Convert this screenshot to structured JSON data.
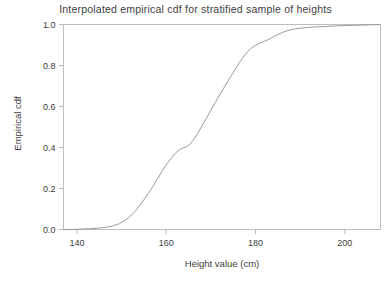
{
  "chart_data": {
    "type": "line",
    "title": "Interpolated empirical cdf for stratified sample of heights",
    "xlabel": "Height value (cm)",
    "ylabel": "Empirical cdf",
    "xlim": [
      137,
      208
    ],
    "ylim": [
      0.0,
      1.0
    ],
    "grid": false,
    "legend": null,
    "xticks": [
      140,
      160,
      180,
      200
    ],
    "xtick_labels": [
      "140",
      "160",
      "180",
      "200"
    ],
    "yticks": [
      0.0,
      0.2,
      0.4,
      0.6,
      0.8,
      1.0
    ],
    "ytick_labels": [
      "0.0",
      "0.2",
      "0.4",
      "0.6",
      "0.8",
      "1.0"
    ],
    "series": [
      {
        "name": "Interpolated empirical cdf",
        "color": "#9a9a9a",
        "x": [
          137.0,
          139.0,
          141.0,
          143.0,
          145.0,
          146.5,
          148.0,
          149.5,
          151.0,
          152.0,
          153.0,
          154.0,
          155.0,
          156.0,
          157.0,
          158.0,
          159.0,
          160.0,
          161.0,
          162.0,
          163.0,
          163.8,
          164.6,
          165.4,
          166.2,
          167.0,
          168.0,
          169.0,
          170.0,
          171.0,
          172.0,
          173.0,
          174.0,
          175.0,
          176.0,
          177.0,
          178.0,
          179.0,
          180.0,
          181.0,
          182.0,
          183.0,
          184.0,
          185.0,
          186.0,
          187.0,
          188.0,
          189.0,
          190.0,
          192.0,
          194.0,
          196.0,
          199.0,
          202.0,
          205.0,
          208.0
        ],
        "y": [
          0.0,
          0.0,
          0.002,
          0.004,
          0.007,
          0.011,
          0.017,
          0.028,
          0.048,
          0.065,
          0.088,
          0.115,
          0.145,
          0.177,
          0.21,
          0.245,
          0.281,
          0.315,
          0.345,
          0.371,
          0.39,
          0.398,
          0.404,
          0.418,
          0.44,
          0.468,
          0.505,
          0.543,
          0.581,
          0.62,
          0.657,
          0.694,
          0.73,
          0.765,
          0.8,
          0.833,
          0.862,
          0.884,
          0.899,
          0.909,
          0.918,
          0.928,
          0.94,
          0.951,
          0.961,
          0.969,
          0.975,
          0.979,
          0.982,
          0.986,
          0.989,
          0.991,
          0.994,
          0.996,
          0.998,
          1.0
        ]
      }
    ]
  }
}
